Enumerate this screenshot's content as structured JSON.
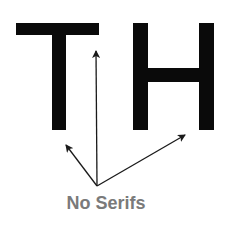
{
  "diagram": {
    "letters": [
      "T",
      "H"
    ],
    "caption": "No Serifs",
    "colors": {
      "letters": "#0a0a0a",
      "arrows": "#1a1a1a",
      "caption": "#7a7a7a",
      "background": "#ffffff"
    },
    "arrows": [
      {
        "name": "arrow-to-t-stem-top",
        "from": [
          97,
          186
        ],
        "to": [
          96,
          50
        ]
      },
      {
        "name": "arrow-to-t-stem-bottom",
        "from": [
          97,
          186
        ],
        "to": [
          65,
          144
        ]
      },
      {
        "name": "arrow-to-h-right-stem-bottom",
        "from": [
          97,
          186
        ],
        "to": [
          186,
          134
        ]
      }
    ]
  }
}
